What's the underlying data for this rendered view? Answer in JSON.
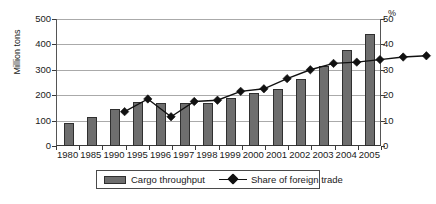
{
  "chart_data": {
    "type": "bar",
    "title": "",
    "subtitle": "",
    "xlabel": "",
    "ylabel": "Million tons",
    "ylabel_secondary": "%",
    "ylim": [
      0,
      500
    ],
    "ylim_secondary": [
      0,
      50
    ],
    "yticks": [
      0,
      100,
      200,
      300,
      400,
      500
    ],
    "yticks_secondary": [
      0,
      10,
      20,
      30,
      40,
      50
    ],
    "grid": true,
    "legend_position": "bottom",
    "categories": [
      "1980",
      "1985",
      "1990",
      "1995",
      "1996",
      "1997",
      "1998",
      "1999",
      "2000",
      "2001",
      "2002",
      "2003",
      "2004",
      "2005"
    ],
    "series": [
      {
        "name": "Cargo throughput",
        "kind": "bar",
        "axis": "left",
        "unit": "Million tons",
        "color": "#6e6e6e",
        "values": [
          90,
          115,
          145,
          172,
          170,
          170,
          170,
          188,
          207,
          225,
          262,
          315,
          378,
          440
        ]
      },
      {
        "name": "Share of foreign trade",
        "kind": "line",
        "axis": "right",
        "unit": "%",
        "color": "#111111",
        "values": [
          21,
          26,
          19,
          25,
          25.5,
          29,
          30,
          34,
          37.5,
          40,
          40.5,
          41.5,
          42.5,
          43
        ]
      }
    ]
  },
  "axes": {
    "left_title": "Million tons",
    "right_title": "%",
    "left_ticks": [
      "500",
      "400",
      "300",
      "200",
      "100",
      "0"
    ],
    "right_ticks": [
      "50",
      "40",
      "30",
      "20",
      "10",
      "0"
    ]
  },
  "legend": {
    "items": [
      {
        "label": "Cargo throughput",
        "marker": "bar-swatch"
      },
      {
        "label": "Share of foreign trade",
        "marker": "line-diamond-swatch"
      }
    ]
  }
}
